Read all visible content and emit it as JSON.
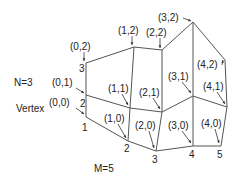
{
  "diagram": {
    "n_label": "N=3",
    "m_label": "M=5",
    "vertex_prefix": "Vertex ",
    "vertices": [
      {
        "id": "v00",
        "label": "(0,0)",
        "x": 86,
        "y": 117,
        "lx": 47,
        "ly": 106,
        "ax": 84,
        "ay": 114,
        "num": "1",
        "nx": 82,
        "ny": 131
      },
      {
        "id": "v01",
        "label": "(0,1)",
        "x": 86,
        "y": 95,
        "lx": 52,
        "ly": 86,
        "ax": 84,
        "ay": 93,
        "num": "2",
        "nx": 80,
        "ny": 107
      },
      {
        "id": "v02",
        "label": "(0,2)",
        "x": 86,
        "y": 63,
        "lx": 70,
        "ly": 50,
        "ax": 84,
        "ay": 61,
        "num": "3",
        "nx": 79,
        "ny": 72
      },
      {
        "id": "v10",
        "label": "(1,0)",
        "x": 128,
        "y": 141,
        "lx": 104,
        "ly": 122,
        "ax": 126,
        "ay": 138,
        "num": "2",
        "nx": 124,
        "ny": 152
      },
      {
        "id": "v11",
        "label": "(1,1)",
        "x": 130,
        "y": 108,
        "lx": 108,
        "ly": 92,
        "ax": 128,
        "ay": 105,
        "num": "",
        "nx": 0,
        "ny": 0
      },
      {
        "id": "v12",
        "label": "(1,2)",
        "x": 134,
        "y": 47,
        "lx": 118,
        "ly": 34,
        "ax": 132,
        "ay": 45,
        "num": "",
        "nx": 0,
        "ny": 0
      },
      {
        "id": "v20",
        "label": "(2,0)",
        "x": 156,
        "y": 151,
        "lx": 135,
        "ly": 129,
        "ax": 154,
        "ay": 148,
        "num": "3",
        "nx": 152,
        "ny": 163
      },
      {
        "id": "v21",
        "label": "(2,1)",
        "x": 162,
        "y": 112,
        "lx": 139,
        "ly": 96,
        "ax": 160,
        "ay": 109,
        "num": "",
        "nx": 0,
        "ny": 0
      },
      {
        "id": "v22",
        "label": "(2,2)",
        "x": 162,
        "y": 50,
        "lx": 146,
        "ly": 36,
        "ax": 160,
        "ay": 48,
        "num": "",
        "nx": 0,
        "ny": 0
      },
      {
        "id": "v30",
        "label": "(3,0)",
        "x": 193,
        "y": 146,
        "lx": 168,
        "ly": 129,
        "ax": 191,
        "ay": 143,
        "num": "4",
        "nx": 189,
        "ny": 158
      },
      {
        "id": "v31",
        "label": "(3,1)",
        "x": 193,
        "y": 96,
        "lx": 168,
        "ly": 80,
        "ax": 191,
        "ay": 93,
        "num": "",
        "nx": 0,
        "ny": 0
      },
      {
        "id": "v32",
        "label": "(3,2)",
        "x": 193,
        "y": 22,
        "lx": 158,
        "ly": 21,
        "ax": 191,
        "ay": 21,
        "num": "",
        "nx": 0,
        "ny": 0
      },
      {
        "id": "v40",
        "label": "(4,0)",
        "x": 221,
        "y": 146,
        "lx": 201,
        "ly": 127,
        "ax": 219,
        "ay": 143,
        "num": "5",
        "nx": 217,
        "ny": 158
      },
      {
        "id": "v41",
        "label": "(4,1)",
        "x": 227,
        "y": 107,
        "lx": 203,
        "ly": 90,
        "ax": 225,
        "ay": 104,
        "num": "",
        "nx": 0,
        "ny": 0
      },
      {
        "id": "v42",
        "label": "(4,2)",
        "x": 225,
        "y": 60,
        "lx": 197,
        "ly": 68,
        "ax": 223,
        "ay": 60,
        "num": "",
        "nx": 0,
        "ny": 0
      }
    ],
    "edges": [
      [
        "v00",
        "v01"
      ],
      [
        "v01",
        "v02"
      ],
      [
        "v10",
        "v11"
      ],
      [
        "v11",
        "v12"
      ],
      [
        "v20",
        "v21"
      ],
      [
        "v21",
        "v22"
      ],
      [
        "v30",
        "v31"
      ],
      [
        "v31",
        "v32"
      ],
      [
        "v40",
        "v41"
      ],
      [
        "v41",
        "v42"
      ],
      [
        "v00",
        "v10"
      ],
      [
        "v10",
        "v20"
      ],
      [
        "v20",
        "v30"
      ],
      [
        "v30",
        "v40"
      ],
      [
        "v01",
        "v11"
      ],
      [
        "v11",
        "v21"
      ],
      [
        "v21",
        "v31"
      ],
      [
        "v31",
        "v41"
      ],
      [
        "v02",
        "v12"
      ],
      [
        "v12",
        "v22"
      ],
      [
        "v22",
        "v32"
      ],
      [
        "v32",
        "v42"
      ]
    ]
  }
}
